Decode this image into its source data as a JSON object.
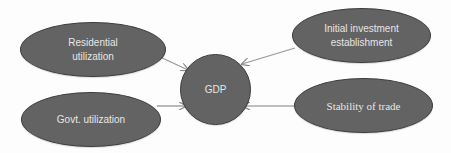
{
  "diagram": {
    "type": "flow",
    "colors": {
      "node_fill": "#636363",
      "node_border": "#3e3e3e",
      "node_text": "#e6e6e6",
      "edge": "#9a9a9a",
      "background": "#fdfdfd"
    },
    "nodes": [
      {
        "id": "residential",
        "label": "Residential\nutilization"
      },
      {
        "id": "govt",
        "label": "Govt. utilization"
      },
      {
        "id": "gdp",
        "label": "GDP"
      },
      {
        "id": "investment",
        "label": "Initial investment\nestablishment"
      },
      {
        "id": "trade",
        "label": "Stability of trade"
      }
    ],
    "edges": [
      {
        "from": "residential",
        "to": "gdp"
      },
      {
        "from": "govt",
        "to": "gdp"
      },
      {
        "from": "investment",
        "to": "gdp"
      },
      {
        "from": "trade",
        "to": "gdp"
      }
    ]
  }
}
